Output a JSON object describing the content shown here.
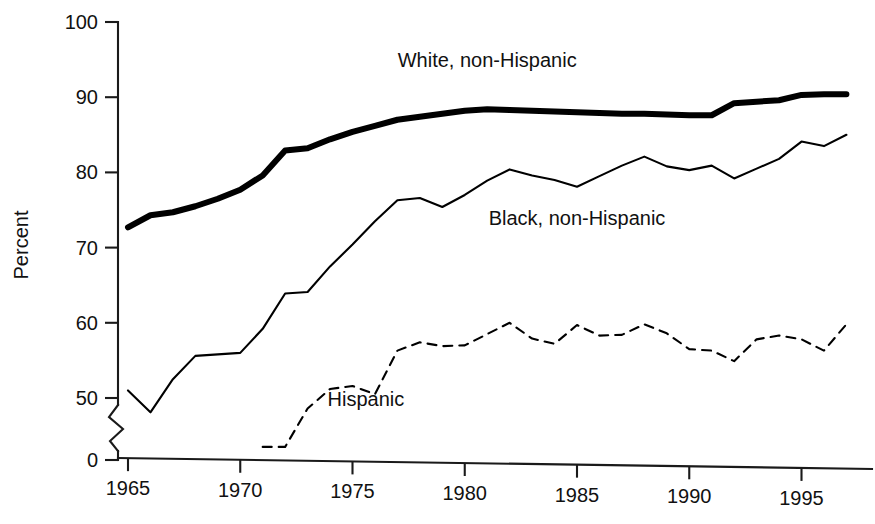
{
  "chart_data": {
    "type": "line",
    "title": "",
    "subtitle": "",
    "xlabel": "",
    "ylabel": "Percent",
    "xlim": [
      1964,
      1998
    ],
    "ylim": [
      0,
      100
    ],
    "y_axis_break": true,
    "y_break_between": [
      0,
      45
    ],
    "grid": false,
    "legend": "inline-labels",
    "x_ticks": [
      "1965",
      "1970",
      "1975",
      "1980",
      "1985",
      "1990",
      "1995"
    ],
    "x_tick_values": [
      1965,
      1970,
      1975,
      1980,
      1985,
      1990,
      1995
    ],
    "y_ticks": [
      "0",
      "50",
      "60",
      "70",
      "80",
      "90",
      "100"
    ],
    "y_tick_values": [
      0,
      50,
      60,
      70,
      80,
      90,
      100
    ],
    "x": [
      1965,
      1966,
      1967,
      1968,
      1969,
      1970,
      1971,
      1972,
      1973,
      1974,
      1975,
      1976,
      1977,
      1978,
      1979,
      1980,
      1981,
      1982,
      1983,
      1984,
      1985,
      1986,
      1987,
      1988,
      1989,
      1990,
      1991,
      1992,
      1993,
      1994,
      1995,
      1996,
      1997
    ],
    "series": [
      {
        "name": "White, non-Hispanic",
        "style": "thick-solid",
        "stroke_width": 6,
        "dash": "none",
        "label_x": 1981,
        "label_y": 94,
        "values": [
          72.7,
          74.3,
          74.7,
          75.5,
          76.5,
          77.7,
          79.6,
          82.9,
          83.2,
          84.4,
          85.4,
          86.2,
          87.0,
          87.4,
          87.8,
          88.2,
          88.4,
          88.3,
          88.2,
          88.1,
          88.0,
          87.9,
          87.8,
          87.8,
          87.7,
          87.6,
          87.6,
          89.2,
          89.4,
          89.6,
          90.3,
          90.4,
          90.4
        ]
      },
      {
        "name": "Black, non-Hispanic",
        "style": "thin-solid",
        "stroke_width": 2.1,
        "dash": "none",
        "label_x": 1985,
        "label_y": 73,
        "values": [
          51.0,
          48.1,
          52.5,
          55.6,
          55.8,
          56.0,
          59.2,
          63.9,
          64.1,
          67.5,
          70.4,
          73.5,
          76.3,
          76.6,
          75.4,
          77.0,
          78.9,
          80.4,
          79.6,
          79.0,
          78.1,
          79.5,
          80.9,
          82.1,
          80.8,
          80.3,
          80.9,
          79.2,
          80.5,
          81.8,
          84.1,
          83.5,
          85.0
        ]
      },
      {
        "name": "Hispanic",
        "style": "dashed",
        "stroke_width": 2.1,
        "dash": "9,7",
        "label_x": 1975.6,
        "label_y": 49,
        "values": [
          null,
          null,
          null,
          null,
          null,
          null,
          43.5,
          43.5,
          48.6,
          51.2,
          51.6,
          50.5,
          56.3,
          57.4,
          56.9,
          57.0,
          58.5,
          60.0,
          57.9,
          57.2,
          59.7,
          58.3,
          58.4,
          59.8,
          58.6,
          56.5,
          56.3,
          54.9,
          57.8,
          58.3,
          57.8,
          56.3,
          59.8
        ]
      }
    ]
  },
  "axis": {
    "ylabel": "Percent"
  }
}
